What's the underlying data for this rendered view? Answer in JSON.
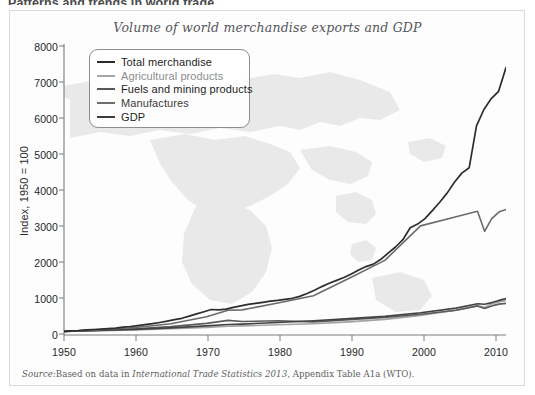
{
  "page_header": "Patterns and trends in world trade",
  "figure": {
    "title": "Volume of world merchandise exports and GDP",
    "source_prefix": "Source:",
    "source_text_a": "Based on data in ",
    "source_italic": "International Trade Statistics 2013",
    "source_text_b": ", Appendix Table A1a (WTO)."
  },
  "chart_data": {
    "type": "line",
    "title": "Volume of world merchandise exports and GDP",
    "xlabel": "",
    "ylabel": "Index, 1950 = 100",
    "xlim": [
      1950,
      2012
    ],
    "ylim": [
      0,
      8000
    ],
    "xticks": [
      1950,
      1960,
      1970,
      1980,
      1990,
      2000,
      2010
    ],
    "yticks": [
      0,
      1000,
      2000,
      3000,
      4000,
      5000,
      6000,
      7000,
      8000
    ],
    "grid": false,
    "legend_position": "upper-left-inside",
    "background_watermark": "world-map",
    "x": [
      1950,
      1955,
      1960,
      1965,
      1970,
      1973,
      1975,
      1980,
      1985,
      1990,
      1995,
      2000,
      2005,
      2008,
      2009,
      2010,
      2011,
      2012
    ],
    "series": [
      {
        "name": "Total merchandise",
        "color": "#3a3a3a",
        "values": [
          100,
          150,
          215,
          330,
          520,
          700,
          710,
          900,
          1060,
          1500,
          1950,
          2950,
          3900,
          4600,
          4200,
          4800,
          5000,
          5100
        ],
        "values_detailed": [
          100,
          112,
          124,
          139,
          150,
          163,
          177,
          190,
          215,
          235,
          258,
          282,
          310,
          345,
          380,
          420,
          460,
          520,
          580,
          640,
          700,
          690,
          710,
          760,
          800,
          840,
          870,
          900,
          930,
          950,
          980,
          1010,
          1060,
          1140,
          1230,
          1330,
          1420,
          1500,
          1580,
          1680,
          1790,
          1880,
          1950,
          2080,
          2250,
          2420,
          2620,
          2950,
          3050,
          3200,
          3420,
          3650,
          3900,
          4200,
          4450,
          4600,
          5750,
          6200,
          6500,
          6700,
          7350
        ]
      },
      {
        "name": "Agricultural products",
        "color": "#9a9a9a",
        "values": [
          100,
          120,
          140,
          170,
          210,
          240,
          250,
          280,
          310,
          360,
          430,
          540,
          680,
          800,
          760,
          860,
          910,
          950
        ],
        "end_value": 950
      },
      {
        "name": "Fuels and mining products",
        "color": "#5a5a5a",
        "values": [
          100,
          130,
          170,
          230,
          320,
          400,
          370,
          390,
          360,
          420,
          480,
          570,
          680,
          800,
          730,
          800,
          850,
          870
        ],
        "end_value": 870
      },
      {
        "name": "Manufactures",
        "color": "#2e2e2e",
        "values": [
          100,
          145,
          205,
          310,
          500,
          680,
          690,
          880,
          1080,
          1560,
          2050,
          3000,
          3250,
          3400,
          2850,
          3200,
          3380,
          3450
        ],
        "end_value": 3450
      },
      {
        "name": "GDP",
        "color": "#404040",
        "values": [
          100,
          125,
          155,
          195,
          250,
          290,
          300,
          345,
          390,
          450,
          510,
          610,
          740,
          860,
          845,
          890,
          950,
          1000
        ],
        "end_value": 1000
      }
    ],
    "annotations": [
      {
        "label": "2008-09 trade collapse",
        "series": "Total merchandise",
        "peak_year": 2008,
        "peak_value": 6900,
        "trough_year": 2009,
        "trough_value": 5750
      },
      {
        "label": "final value",
        "series": "Total merchandise",
        "year": 2012,
        "value": 7350
      },
      {
        "label": "1974-75 oil shock plateau",
        "series": "Fuels and mining products",
        "year": 1974,
        "value": 400
      }
    ]
  },
  "legend": {
    "items": [
      {
        "label": "Total merchandise",
        "color": "#2b2b2b"
      },
      {
        "label": "Agricultural products",
        "color": "#a6a6a6"
      },
      {
        "label": "Fuels and mining products",
        "color": "#585858"
      },
      {
        "label": "Manufactures",
        "color": "#6e6e6e"
      },
      {
        "label": "GDP",
        "color": "#3d3d3d"
      }
    ]
  },
  "axes": {
    "y_title": "Index, 1950 = 100",
    "y_ticks": [
      "8000",
      "7000",
      "6000",
      "5000",
      "4000",
      "3000",
      "2000",
      "1000",
      "0"
    ],
    "x_ticks": [
      "1950",
      "1960",
      "1970",
      "1980",
      "1990",
      "2000",
      "2010"
    ]
  }
}
